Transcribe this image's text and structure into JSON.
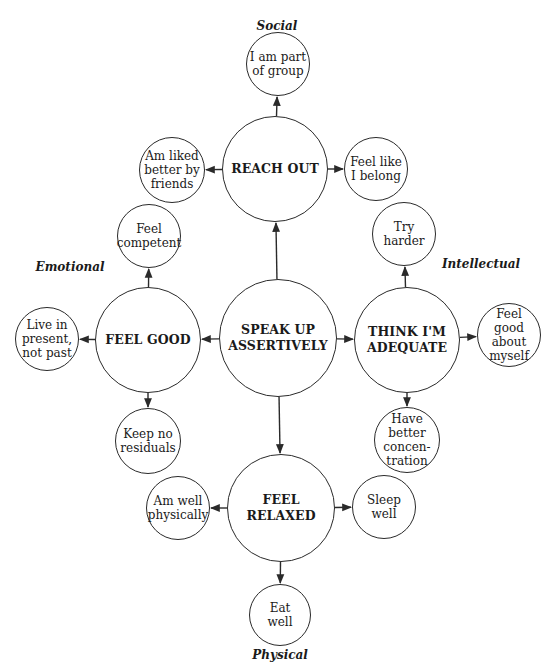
{
  "diagram": {
    "type": "concept-map",
    "center": {
      "id": "speak-up",
      "label": "SPEAK UP\nASSERTIVELY",
      "cx": 278,
      "cy": 338,
      "r": 59
    },
    "categories": [
      {
        "id": "social",
        "label": "Social",
        "x": 277,
        "y": 26
      },
      {
        "id": "emotional",
        "label": "Emotional",
        "x": 70,
        "y": 267
      },
      {
        "id": "intellectual",
        "label": "Intellectual",
        "x": 481,
        "y": 264
      },
      {
        "id": "physical",
        "label": "Physical",
        "x": 280,
        "y": 655
      }
    ],
    "hubs": [
      {
        "id": "reach-out",
        "label": "REACH OUT",
        "category": "Social",
        "cx": 275,
        "cy": 169,
        "r": 53
      },
      {
        "id": "feel-good",
        "label": "FEEL GOOD",
        "category": "Emotional",
        "cx": 148,
        "cy": 340,
        "r": 53
      },
      {
        "id": "think-adequate",
        "label": "THINK I'M\nADEQUATE",
        "category": "Intellectual",
        "cx": 407,
        "cy": 340,
        "r": 53
      },
      {
        "id": "feel-relaxed",
        "label": "FEEL RELAXED",
        "category": "Physical",
        "cx": 281,
        "cy": 508,
        "r": 54
      }
    ],
    "outcomes": [
      {
        "id": "part-of-group",
        "label": "I am part\nof group",
        "hub": "reach-out",
        "cx": 278,
        "cy": 64,
        "r": 32
      },
      {
        "id": "liked-by-friends",
        "label": "Am liked\nbetter by\nfriends",
        "hub": "reach-out",
        "cx": 172,
        "cy": 170,
        "r": 33
      },
      {
        "id": "feel-belong",
        "label": "Feel like\nI belong",
        "hub": "reach-out",
        "cx": 376,
        "cy": 169,
        "r": 32
      },
      {
        "id": "feel-competent",
        "label": "Feel\ncompetent",
        "hub": "feel-good",
        "cx": 149,
        "cy": 236,
        "r": 32
      },
      {
        "id": "live-present",
        "label": "Live in\npresent,\nnot past",
        "hub": "feel-good",
        "cx": 47,
        "cy": 339,
        "r": 32
      },
      {
        "id": "keep-no-residuals",
        "label": "Keep no\nresiduals",
        "hub": "feel-good",
        "cx": 148,
        "cy": 441,
        "r": 33
      },
      {
        "id": "try-harder",
        "label": "Try\nharder",
        "hub": "think-adequate",
        "cx": 404,
        "cy": 234,
        "r": 32
      },
      {
        "id": "feel-good-myself",
        "label": "Feel\ngood about\nmyself",
        "hub": "think-adequate",
        "cx": 509,
        "cy": 335,
        "r": 32
      },
      {
        "id": "better-concentration",
        "label": "Have\nbetter\nconcen-\ntration",
        "hub": "think-adequate",
        "cx": 407,
        "cy": 440,
        "r": 33
      },
      {
        "id": "well-physically",
        "label": "Am well\nphysically",
        "hub": "feel-relaxed",
        "cx": 178,
        "cy": 508,
        "r": 32
      },
      {
        "id": "sleep-well",
        "label": "Sleep\nwell",
        "hub": "feel-relaxed",
        "cx": 384,
        "cy": 507,
        "r": 32
      },
      {
        "id": "eat-well",
        "label": "Eat\nwell",
        "hub": "feel-relaxed",
        "cx": 280,
        "cy": 615,
        "r": 31
      }
    ],
    "colors": {
      "stroke": "#2a2a2a",
      "text": "#1a1a1a",
      "background": "#ffffff"
    }
  }
}
